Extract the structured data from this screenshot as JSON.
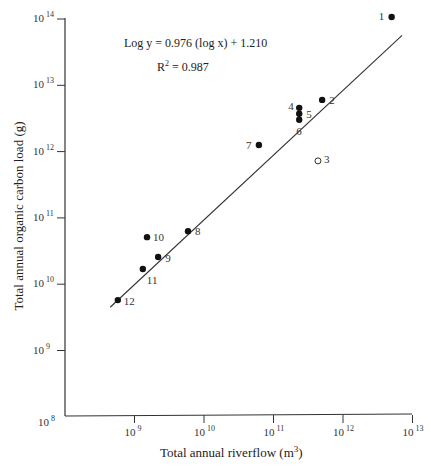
{
  "chart_data": {
    "type": "scatter",
    "title": "",
    "xlabel": "Total annual riverflow (m³)",
    "xlabel_base": "Total annual riverflow (m",
    "xlabel_sup": "3",
    "xlabel_end": ")",
    "ylabel": "Total annual organic carbon load (g)",
    "xscale": "log",
    "yscale": "log",
    "xlim_log10": [
      8,
      13
    ],
    "ylim_log10": [
      8,
      14
    ],
    "grid": false,
    "legend": null,
    "x_ticks": [
      {
        "base": "10",
        "exp": "9"
      },
      {
        "base": "10",
        "exp": "10"
      },
      {
        "base": "10",
        "exp": "11"
      },
      {
        "base": "10",
        "exp": "12"
      },
      {
        "base": "10",
        "exp": "13"
      }
    ],
    "y_ticks": [
      {
        "base": "10",
        "exp": "8"
      },
      {
        "base": "10",
        "exp": "9"
      },
      {
        "base": "10",
        "exp": "10"
      },
      {
        "base": "10",
        "exp": "11"
      },
      {
        "base": "10",
        "exp": "12"
      },
      {
        "base": "10",
        "exp": "13"
      },
      {
        "base": "10",
        "exp": "14"
      }
    ],
    "annotations": {
      "equation": "Log y = 0.976 (log x) + 1.210",
      "r2_prefix": "R",
      "r2_sup": "2",
      "r2_value": " = 0.987"
    },
    "regression": {
      "slope": 0.976,
      "intercept": 1.21,
      "r_squared": 0.987,
      "x_log10_range": [
        8.65,
        12.85
      ]
    },
    "series": [
      {
        "name": "rivers",
        "points": [
          {
            "label": "1",
            "log10_x": 12.7,
            "log10_y": 14.03,
            "filled": true
          },
          {
            "label": "2",
            "log10_x": 11.7,
            "log10_y": 12.78,
            "filled": true
          },
          {
            "label": "3",
            "log10_x": 11.64,
            "log10_y": 11.86,
            "filled": false
          },
          {
            "label": "4",
            "log10_x": 11.37,
            "log10_y": 12.66,
            "filled": true
          },
          {
            "label": "5",
            "log10_x": 11.37,
            "log10_y": 12.57,
            "filled": true
          },
          {
            "label": "6",
            "log10_x": 11.37,
            "log10_y": 12.48,
            "filled": true
          },
          {
            "label": "7",
            "log10_x": 10.79,
            "log10_y": 12.1,
            "filled": true
          },
          {
            "label": "8",
            "log10_x": 9.77,
            "log10_y": 10.8,
            "filled": true
          },
          {
            "label": "9",
            "log10_x": 9.34,
            "log10_y": 10.41,
            "filled": true
          },
          {
            "label": "10",
            "log10_x": 9.18,
            "log10_y": 10.71,
            "filled": true
          },
          {
            "label": "11",
            "log10_x": 9.12,
            "log10_y": 10.23,
            "filled": true
          },
          {
            "label": "12",
            "log10_x": 8.76,
            "log10_y": 9.76,
            "filled": true
          }
        ]
      }
    ]
  }
}
